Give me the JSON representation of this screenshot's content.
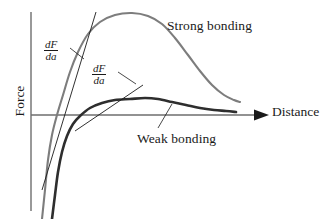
{
  "chart_data": {
    "type": "line",
    "title": "",
    "xlabel": "Distance",
    "ylabel": "Force",
    "grid": false,
    "legend": "inline-annotations",
    "axes": {
      "x_axis_label": "Distance",
      "y_axis_label": "Force",
      "x_arrow": true,
      "y_arrow": false,
      "origin_note": "Force zero line is the horizontal x-axis",
      "tick_labels_x": [],
      "tick_labels_y": []
    },
    "series": [
      {
        "name": "Strong bonding",
        "color": "#7d7d7d",
        "stroke_width": 2.1,
        "peak_label": "Strong bonding",
        "description": "Steep rise from large negative force, crosses zero early, tall broad maximum, gradual decay toward zero",
        "points": [
          [
            42,
            219
          ],
          [
            45,
            190
          ],
          [
            48,
            160
          ],
          [
            52,
            135
          ],
          [
            57,
            115
          ],
          [
            63,
            95
          ],
          [
            70,
            72
          ],
          [
            78,
            52
          ],
          [
            88,
            34
          ],
          [
            100,
            22
          ],
          [
            115,
            15
          ],
          [
            132,
            13
          ],
          [
            148,
            16
          ],
          [
            162,
            24
          ],
          [
            175,
            38
          ],
          [
            188,
            55
          ],
          [
            200,
            71
          ],
          [
            212,
            85
          ],
          [
            224,
            95
          ],
          [
            234,
            100
          ],
          [
            240,
            102
          ]
        ]
      },
      {
        "name": "Weak bonding",
        "color": "#2e2e2e",
        "stroke_width": 2.6,
        "peak_label": "Weak bonding",
        "description": "Steep rise from large negative force, crosses zero later, shallow low maximum, slow decay toward zero",
        "points": [
          [
            52,
            219
          ],
          [
            55,
            195
          ],
          [
            58,
            172
          ],
          [
            62,
            152
          ],
          [
            67,
            136
          ],
          [
            73,
            124
          ],
          [
            80,
            116
          ],
          [
            90,
            108
          ],
          [
            102,
            103
          ],
          [
            115,
            100
          ],
          [
            130,
            99
          ],
          [
            145,
            98
          ],
          [
            158,
            99
          ],
          [
            172,
            102
          ],
          [
            186,
            105
          ],
          [
            200,
            108
          ],
          [
            214,
            110
          ],
          [
            226,
            111
          ],
          [
            236,
            112
          ]
        ]
      }
    ],
    "tangents": [
      {
        "name": "dF/da strong bonding slope",
        "label": "dF/da",
        "numerator": "dF",
        "denominator": "da",
        "x1": 96,
        "y1": 12,
        "x2": 42,
        "y2": 190,
        "color": "#1a1a1a",
        "stroke_width": 0.9
      },
      {
        "name": "dF/da weak bonding slope",
        "label": "dF/da",
        "numerator": "dF",
        "denominator": "da",
        "x1": 143,
        "y1": 85,
        "x2": 75,
        "y2": 131,
        "color": "#1a1a1a",
        "stroke_width": 0.9
      }
    ],
    "leaders": [
      {
        "name": "dF-da-strong-leader",
        "x1": 70,
        "y1": 48,
        "x2": 84,
        "y2": 59
      },
      {
        "name": "dF-da-weak-leader",
        "x1": 118,
        "y1": 72,
        "x2": 136,
        "y2": 84
      },
      {
        "name": "weak-bonding-leader",
        "x1": 158,
        "y1": 128,
        "x2": 172,
        "y2": 104
      }
    ]
  },
  "labels": {
    "strong_bonding": "Strong bonding",
    "weak_bonding": "Weak bonding",
    "distance": "Distance",
    "force": "Force",
    "dfda_numerator": "dF",
    "dfda_denominator": "da"
  },
  "colors": {
    "strong_curve": "#7d7d7d",
    "weak_curve": "#2e2e2e",
    "axis": "#6e6e6e",
    "text": "#1a1a1a",
    "background": "#ffffff"
  }
}
